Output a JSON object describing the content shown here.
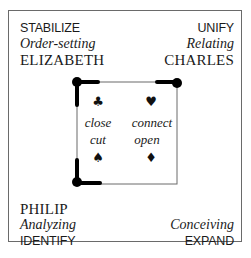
{
  "quadrants": {
    "top_left": {
      "verb": "STABILIZE",
      "mode": "Order-setting",
      "name": "ELIZABETH"
    },
    "top_right": {
      "verb": "UNIFY",
      "mode": "Relating",
      "name": "CHARLES"
    },
    "bottom_left": {
      "name": "PHILIP",
      "mode": "Analyzing",
      "verb": "IDENTIFY"
    },
    "bottom_right": {
      "mode": "Conceiving",
      "verb": "EXPAND"
    }
  },
  "inner_square": {
    "suits": {
      "top_left": "♣",
      "top_right": "♥",
      "bottom_left": "♠",
      "bottom_right": "♦"
    },
    "labels": {
      "close": "close",
      "connect": "connect",
      "cut": "cut",
      "open": "open"
    }
  },
  "colors": {
    "border": "#6a6a6a",
    "emphasis": "#000000",
    "text": "#1a1a1a"
  }
}
